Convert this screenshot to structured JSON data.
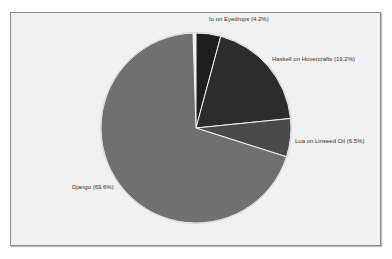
{
  "chart_data": {
    "type": "pie",
    "title": "",
    "start_angle": "top (12 o'clock), clockwise",
    "categories": [
      "Io on Eyedrops",
      "Haskell on Hovercrafts",
      "Lua on Linseed Oil",
      "Django"
    ],
    "values": [
      4.2,
      19.2,
      6.5,
      69.6
    ],
    "unit": "%",
    "colors": [
      "#1e1e1e",
      "#2c2c2c",
      "#4a4a4a",
      "#707070"
    ],
    "labels": [
      "Io on Eyedrops (4.2%)",
      "Haskell on Hovercrafts (19.2%)",
      "Lua on Linseed Oil (6.5%)",
      "Django (69.6%)"
    ],
    "legend": "none (inline slice labels)"
  },
  "labels": {
    "io": "Io on Eyedrops (4.2%)",
    "haskell": "Haskell on Hovercrafts (19.2%)",
    "lua": "Lua on Linseed Oil (6.5%)",
    "django": "Django (69.6%)"
  }
}
